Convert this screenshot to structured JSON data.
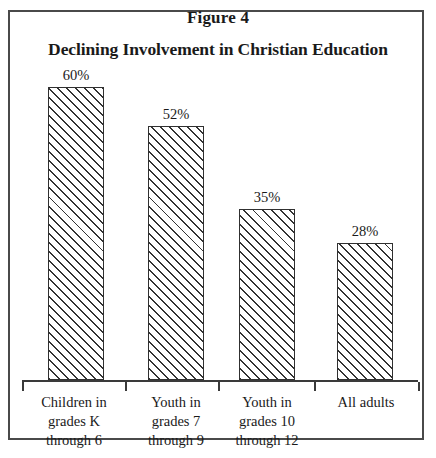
{
  "figure": {
    "caption": "Figure 4",
    "frame_color": "#4a4a4a"
  },
  "chart_data": {
    "type": "bar",
    "title": "Declining Involvement in Christian Education",
    "subtitle": "",
    "xlabel": "",
    "ylabel": "",
    "ylim": [
      0,
      60
    ],
    "grid": false,
    "legend": null,
    "axis": {
      "baseline_visible": true,
      "ticks_between_categories": true,
      "tick_count": 5
    },
    "categories": [
      "Children in grades K through 6",
      "Youth in grades 7 through 9",
      "Youth in grades 10 through 12",
      "All adults"
    ],
    "category_label_lines": [
      [
        "Children in",
        "grades K",
        "through 6"
      ],
      [
        "Youth in",
        "grades 7",
        "through 9"
      ],
      [
        "Youth in",
        "grades 10",
        "through 12"
      ],
      [
        "All adults"
      ]
    ],
    "values": [
      60,
      52,
      35,
      28
    ],
    "data_labels": [
      "60%",
      "52%",
      "35%",
      "28%"
    ],
    "bar_style": {
      "fill": "diagonal-hatch",
      "hatch_direction": "forward-slash",
      "border_color": "#303030",
      "background": "#ffffff"
    }
  },
  "layout": {
    "baseline_y": 380,
    "axis_left": 22,
    "axis_right": 418,
    "px_per_percent": 4.88,
    "bar_width": 56,
    "bar_lefts": [
      48,
      148,
      239,
      337
    ],
    "tick_positions": [
      22,
      125,
      218,
      314,
      418
    ],
    "label_centers": [
      74,
      176,
      267,
      366
    ]
  }
}
